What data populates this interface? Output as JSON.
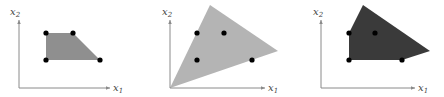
{
  "colors": {
    "axis": "#8a8a8a",
    "label": "#444444",
    "point": "#000000",
    "panel1_fill": "#8f8f8f",
    "panel2_fill": "#b4b4b4",
    "panel3_fill": "#3a3a3a"
  },
  "panels": [
    {
      "id": "integer-hull",
      "x_label": "x",
      "x_sub": "1",
      "y_label": "x",
      "y_sub": "2",
      "origin": [
        19,
        88
      ],
      "x_axis_end": [
        110,
        88
      ],
      "y_axis_end": [
        19,
        20
      ],
      "x_label_pos": [
        113,
        91
      ],
      "y_label_pos": [
        10,
        15
      ],
      "polygon": "46,33 73,33 100,60 46,60",
      "points": [
        [
          46,
          33
        ],
        [
          73,
          33
        ],
        [
          100,
          60
        ],
        [
          46,
          60
        ]
      ]
    },
    {
      "id": "cone-relaxation",
      "x_label": "x",
      "x_sub": "1",
      "y_label": "x",
      "y_sub": "2",
      "origin": [
        170,
        88
      ],
      "x_axis_end": [
        265,
        88
      ],
      "y_axis_end": [
        170,
        20
      ],
      "x_label_pos": [
        268,
        91
      ],
      "y_label_pos": [
        162,
        15
      ],
      "polygon": "170,88 210,5 278,51",
      "points": [
        [
          197,
          33
        ],
        [
          224,
          33
        ],
        [
          197,
          60
        ],
        [
          252,
          60
        ]
      ]
    },
    {
      "id": "lp-relaxation",
      "x_label": "x",
      "x_sub": "1",
      "y_label": "x",
      "y_sub": "2",
      "origin": [
        321,
        88
      ],
      "x_axis_end": [
        415,
        88
      ],
      "y_axis_end": [
        321,
        20
      ],
      "x_label_pos": [
        418,
        91
      ],
      "y_label_pos": [
        313,
        15
      ],
      "polygon": "349,60 349,33 363,5 430,51 402,60",
      "points": [
        [
          349,
          33
        ],
        [
          375,
          33
        ],
        [
          349,
          60
        ],
        [
          402,
          60
        ]
      ]
    }
  ]
}
